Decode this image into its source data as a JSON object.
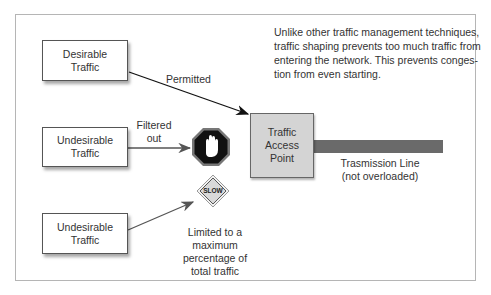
{
  "diagram": {
    "description": "Unlike other traffic management techniques, traffic shaping prevents too much traffic from entering the network. This prevents conges-tion from even starting.",
    "sources": [
      {
        "label_line1": "Desirable",
        "label_line2": "Traffic"
      },
      {
        "label_line1": "Undesirable",
        "label_line2": "Traffic"
      },
      {
        "label_line1": "Undesirable",
        "label_line2": "Traffic"
      }
    ],
    "arrows": {
      "permitted": "Permitted",
      "filtered_line1": "Filtered",
      "filtered_line2": "out",
      "limited_line1": "Limited to a",
      "limited_line2": "maximum",
      "limited_line3": "percentage of",
      "limited_line4": "total traffic"
    },
    "signs": {
      "stop_icon": "stop-hand-icon",
      "slow_text": "SLOW"
    },
    "access_point": {
      "line1": "Traffic",
      "line2": "Access",
      "line3": "Point"
    },
    "transmission": {
      "line1": "Trasmission Line",
      "line2": "(not overloaded)"
    },
    "colors": {
      "line": "#6a6a6a",
      "access_point": "#d4d4d4",
      "stop": "#1a1a1a",
      "slow": "#d9d9d9"
    }
  }
}
